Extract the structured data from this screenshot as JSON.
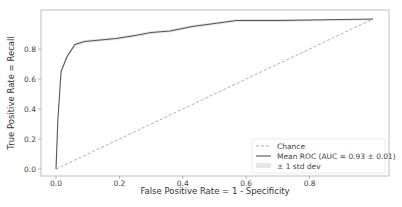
{
  "chart_data": {
    "type": "line",
    "title": "",
    "xlabel": "False Positive Rate = 1 - Specificity",
    "ylabel": "True Positive Rate = Recall",
    "xlim": [
      -0.05,
      1.05
    ],
    "ylim": [
      -0.05,
      1.05
    ],
    "x_ticks": [
      "0.0",
      "0.2",
      "0.4",
      "0.6",
      "0.8"
    ],
    "y_ticks": [
      "0.0",
      "0.2",
      "0.4",
      "0.6",
      "0.8"
    ],
    "grid": false,
    "legend_position": "lower right",
    "series": [
      {
        "name": "Chance",
        "style": "dashed",
        "color": "#999999",
        "x": [
          0.0,
          1.0
        ],
        "y": [
          0.0,
          1.0
        ]
      },
      {
        "name": "Mean ROC (AUC = 0.93 ± 0.01)",
        "style": "solid",
        "color": "#555555",
        "x": [
          0.0,
          0.006,
          0.016,
          0.035,
          0.06,
          0.09,
          0.14,
          0.19,
          0.25,
          0.3,
          0.36,
          0.43,
          0.5,
          0.57,
          0.7,
          0.85,
          1.0
        ],
        "y": [
          0.0,
          0.33,
          0.65,
          0.75,
          0.83,
          0.85,
          0.86,
          0.87,
          0.89,
          0.91,
          0.92,
          0.95,
          0.97,
          0.99,
          0.99,
          0.995,
          1.0
        ]
      },
      {
        "name": "± 1 std dev",
        "style": "band",
        "color": "#dddddd",
        "std": 0.01
      }
    ],
    "annotations": []
  },
  "legend": {
    "items": [
      {
        "label": "Chance"
      },
      {
        "label": "Mean ROC (AUC = 0.93 ± 0.01)"
      },
      {
        "label": "± 1 std dev"
      }
    ]
  },
  "axes": {
    "xlabel": "False Positive Rate = 1 - Specificity",
    "ylabel": "True Positive Rate = Recall",
    "x_ticks": [
      {
        "label": "0.0",
        "value": 0.0
      },
      {
        "label": "0.2",
        "value": 0.2
      },
      {
        "label": "0.4",
        "value": 0.4
      },
      {
        "label": "0.6",
        "value": 0.6
      },
      {
        "label": "0.8",
        "value": 0.8
      }
    ],
    "y_ticks": [
      {
        "label": "0.0",
        "value": 0.0
      },
      {
        "label": "0.2",
        "value": 0.2
      },
      {
        "label": "0.4",
        "value": 0.4
      },
      {
        "label": "0.6",
        "value": 0.6
      },
      {
        "label": "0.8",
        "value": 0.8
      }
    ]
  },
  "colors": {
    "frame": "#aaaaaa",
    "mean_roc": "#555555",
    "chance": "#999999",
    "band": "#e2e2e2"
  }
}
